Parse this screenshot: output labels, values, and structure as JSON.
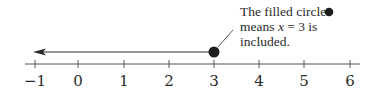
{
  "diagram": {
    "type": "number-line",
    "axis": {
      "min": -1,
      "max": 6,
      "ticks": [
        {
          "value": -1,
          "label": "−1",
          "x": 35
        },
        {
          "value": 0,
          "label": "0",
          "x": 78
        },
        {
          "value": 1,
          "label": "1",
          "x": 124
        },
        {
          "value": 2,
          "label": "2",
          "x": 169
        },
        {
          "value": 3,
          "label": "3",
          "x": 214
        },
        {
          "value": 4,
          "label": "4",
          "x": 259
        },
        {
          "value": 5,
          "label": "5",
          "x": 304
        },
        {
          "value": 6,
          "label": "6",
          "x": 350
        }
      ]
    },
    "ray": {
      "from": 3,
      "direction": "left",
      "endpoint": "filled-circle",
      "meaning": "x <= 3"
    },
    "annotation": {
      "line1": "The filled circle",
      "line2_prefix": "means ",
      "line2_var": "x",
      "line2_suffix": " = 3 is",
      "line3": "included."
    },
    "colors": {
      "ink": "#2a2a2a",
      "axis": "#555555",
      "background": "#ffffff"
    }
  }
}
